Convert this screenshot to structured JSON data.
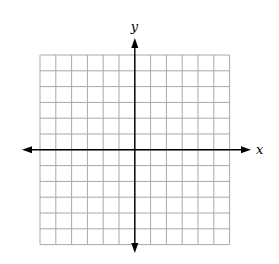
{
  "chart_data": {
    "type": "coordinate-grid",
    "title": "",
    "xlabel": "x",
    "ylabel": "y",
    "grid": true,
    "columns": 12,
    "rows": 12,
    "origin_cell": {
      "col": 6,
      "row": 6
    },
    "x_range": [
      -6,
      6
    ],
    "y_range": [
      -6,
      6
    ],
    "series": []
  },
  "labels": {
    "x_axis": "x",
    "y_axis": "y"
  },
  "colors": {
    "grid": "#a8a8a8",
    "axis": "#000000",
    "background": "#ffffff"
  },
  "layout": {
    "grid_left": 40,
    "grid_top": 55,
    "cell": 15.8,
    "origin_x": 135,
    "origin_y": 150,
    "x_axis_left": 22,
    "x_axis_right": 251,
    "y_axis_top": 38,
    "y_axis_bottom": 253
  }
}
